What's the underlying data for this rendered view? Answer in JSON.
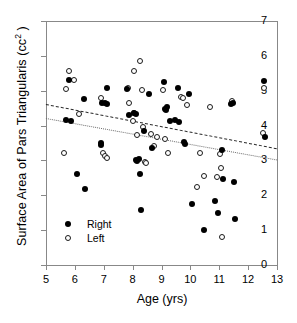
{
  "chart_data": {
    "type": "scatter",
    "title": "",
    "xlabel": "Age (yrs)",
    "ylabel": "Surface Area of Pars Triangularis (cc²)",
    "ylabel_base": "Surface Area of Pars Triangularis (cc",
    "ylabel_sup": "2",
    "ylabel_tail": " )",
    "xlim": [
      5,
      13
    ],
    "ylim": [
      0,
      7
    ],
    "xticks": [
      5,
      6,
      7,
      8,
      9,
      10,
      11,
      12,
      13
    ],
    "yticks": [
      0,
      1,
      2,
      3,
      4,
      5,
      6,
      7
    ],
    "grid": false,
    "legend_position": "lower-left",
    "series": [
      {
        "name": "Right",
        "marker": "filled-circle",
        "color": "#000000",
        "points": [
          [
            5.78,
            5.32
          ],
          [
            5.68,
            4.17
          ],
          [
            5.86,
            4.14
          ],
          [
            6.08,
            2.61
          ],
          [
            6.32,
            4.75
          ],
          [
            6.34,
            2.19
          ],
          [
            6.9,
            3.5
          ],
          [
            6.92,
            3.44
          ],
          [
            6.95,
            4.66
          ],
          [
            7.06,
            4.65
          ],
          [
            7.1,
            5.07
          ],
          [
            7.12,
            4.63
          ],
          [
            7.82,
            5.04
          ],
          [
            7.86,
            4.3
          ],
          [
            8.06,
            4.36
          ],
          [
            8.1,
            4.33
          ],
          [
            8.12,
            3.02
          ],
          [
            8.16,
            2.98
          ],
          [
            8.22,
            3.03
          ],
          [
            8.26,
            2.6
          ],
          [
            8.3,
            1.58
          ],
          [
            8.38,
            3.85
          ],
          [
            8.56,
            4.91
          ],
          [
            8.68,
            3.36
          ],
          [
            9.08,
            5.24
          ],
          [
            9.12,
            4.48
          ],
          [
            9.16,
            4.44
          ],
          [
            9.2,
            4.53
          ],
          [
            9.28,
            4.14
          ],
          [
            9.48,
            4.15
          ],
          [
            9.56,
            5.08
          ],
          [
            9.62,
            4.11
          ],
          [
            9.78,
            3.53
          ],
          [
            9.82,
            3.47
          ],
          [
            9.96,
            4.92
          ],
          [
            10.04,
            1.76
          ],
          [
            10.46,
            1.0
          ],
          [
            10.86,
            1.83
          ],
          [
            10.94,
            1.48
          ],
          [
            11.08,
            3.29
          ],
          [
            11.12,
            2.48
          ],
          [
            11.42,
            4.62
          ],
          [
            11.46,
            4.66
          ],
          [
            11.52,
            2.39
          ],
          [
            11.54,
            1.33
          ],
          [
            12.56,
            5.28
          ],
          [
            12.6,
            3.66
          ]
        ]
      },
      {
        "name": "Left",
        "marker": "open-circle",
        "color": "#ffffff",
        "points": [
          [
            5.62,
            3.2
          ],
          [
            5.7,
            5.04
          ],
          [
            5.78,
            5.56
          ],
          [
            5.96,
            5.3
          ],
          [
            6.14,
            4.33
          ],
          [
            6.92,
            4.78
          ],
          [
            6.96,
            3.2
          ],
          [
            7.06,
            3.12
          ],
          [
            7.1,
            3.07
          ],
          [
            7.84,
            5.07
          ],
          [
            7.88,
            4.66
          ],
          [
            8.0,
            4.12
          ],
          [
            8.04,
            4.37
          ],
          [
            8.06,
            5.56
          ],
          [
            8.14,
            3.73
          ],
          [
            8.26,
            5.86
          ],
          [
            8.32,
            5.02
          ],
          [
            8.36,
            3.96
          ],
          [
            8.42,
            2.96
          ],
          [
            8.46,
            2.94
          ],
          [
            8.62,
            3.75
          ],
          [
            8.74,
            3.4
          ],
          [
            8.86,
            3.66
          ],
          [
            9.06,
            5.01
          ],
          [
            9.12,
            3.62
          ],
          [
            9.22,
            3.22
          ],
          [
            9.68,
            4.82
          ],
          [
            9.74,
            4.78
          ],
          [
            9.88,
            4.6
          ],
          [
            10.22,
            2.25
          ],
          [
            10.34,
            3.2
          ],
          [
            10.46,
            2.56
          ],
          [
            10.68,
            4.53
          ],
          [
            10.92,
            2.53
          ],
          [
            11.02,
            3.18
          ],
          [
            11.06,
            2.78
          ],
          [
            11.1,
            0.81
          ],
          [
            11.44,
            4.7
          ],
          [
            12.54,
            5.08
          ],
          [
            12.5,
            3.78
          ]
        ]
      }
    ],
    "trendlines": [
      {
        "name": "Right",
        "style": "dashed",
        "color": "#2a2a2a",
        "x0": 5.0,
        "y0": 4.62,
        "x1": 13.0,
        "y1": 3.35
      },
      {
        "name": "Left",
        "style": "dotted",
        "color": "#6e6e6e",
        "x0": 5.0,
        "y0": 4.22,
        "x1": 13.0,
        "y1": 3.03
      }
    ]
  },
  "legend": {
    "items": [
      {
        "label": "Right",
        "marker": "filled-circle"
      },
      {
        "label": "Left",
        "marker": "open-circle"
      }
    ]
  }
}
